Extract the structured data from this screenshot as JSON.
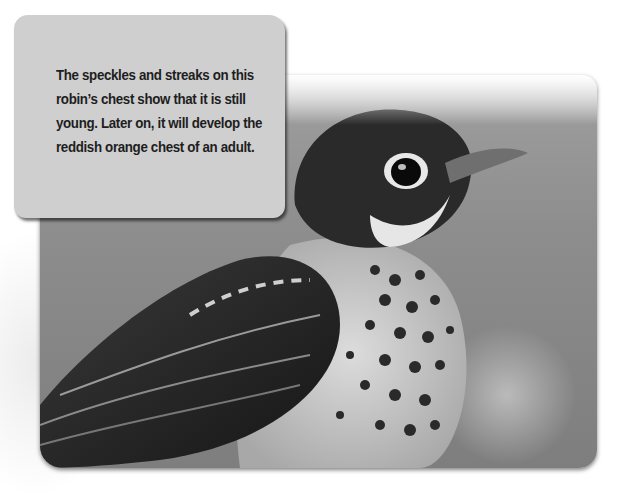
{
  "caption": {
    "text": "The speckles and streaks on this robin’s chest show that it is still young. Later on, it will develop the reddish orange chest of an adult."
  },
  "photo": {
    "subject": "juvenile robin, grayscale photo"
  },
  "colors": {
    "caption_bg": "#cfcfcf",
    "caption_text": "#1e1e1e",
    "page_bg": "#ffffff"
  }
}
